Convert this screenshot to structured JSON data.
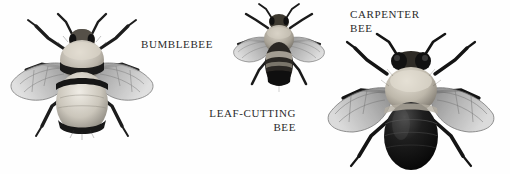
{
  "plate": {
    "title": "Bee species illustration plate",
    "background_color": "#fefefe",
    "ink_color": "#2b2b2b",
    "width": 510,
    "height": 174
  },
  "captions": {
    "bumblebee": "BUMBLEBEE",
    "leaf_cutting_line1": "LEAF-CUTTING",
    "leaf_cutting_line2": "BEE",
    "carpenter_line1": "CARPENTER",
    "carpenter_line2": "BEE"
  },
  "figures": [
    {
      "name": "bumblebee",
      "label": "BUMBLEBEE",
      "description": "Large furry bee, dorsal view, banded thorax and abdomen, wings spread",
      "body_tone": "#d8d4cc",
      "band_tone": "#1a1a1a",
      "wing_tone": "#9a9a9a"
    },
    {
      "name": "leaf-cutting-bee",
      "label": "LEAF-CUTTING BEE",
      "description": "Smaller slender bee, dorsal view, dark banded abdomen, wings spread",
      "body_tone": "#b8b2a8",
      "band_tone": "#141414",
      "wing_tone": "#a6a6a6"
    },
    {
      "name": "carpenter-bee",
      "label": "CARPENTER BEE",
      "description": "Robust bee with glossy black segmented abdomen, pale fuzzy thorax, large dark eyes",
      "body_tone": "#cfcabf",
      "band_tone": "#0d0d0d",
      "wing_tone": "#8f8f8f"
    }
  ]
}
